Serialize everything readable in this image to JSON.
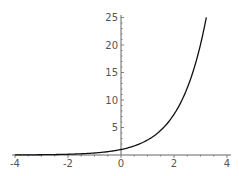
{
  "chart_data": {
    "type": "line",
    "title": "",
    "xlabel": "",
    "ylabel": "",
    "function": "y = e^x",
    "xlim": [
      -4,
      4
    ],
    "ylim": [
      0,
      25
    ],
    "grid": false,
    "legend": null,
    "x_ticks": [
      -4,
      -2,
      0,
      2,
      4
    ],
    "x_tick_labels": [
      "-4",
      "-2",
      "0",
      "2",
      "4"
    ],
    "y_ticks": [
      5,
      10,
      15,
      20,
      25
    ],
    "y_tick_labels": [
      "5",
      "10",
      "15",
      "20",
      "25"
    ],
    "series": [
      {
        "name": "exp(x)",
        "x": [
          -4,
          -3,
          -2,
          -1,
          0,
          0.5,
          1,
          1.5,
          2,
          2.5,
          3,
          3.2
        ],
        "y": [
          0.02,
          0.05,
          0.14,
          0.37,
          1,
          1.65,
          2.72,
          4.48,
          7.39,
          12.18,
          20.09,
          24.5
        ]
      }
    ],
    "colors": {
      "curve": "#111111",
      "axis": "#666666",
      "text": "#555555"
    }
  }
}
